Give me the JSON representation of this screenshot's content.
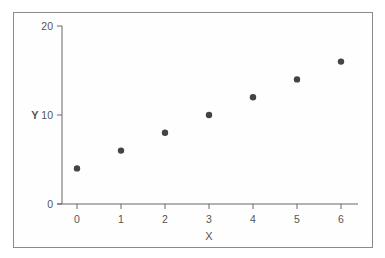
{
  "chart_data": {
    "type": "scatter",
    "title": "",
    "xlabel": "X",
    "ylabel": "Y",
    "x": [
      0,
      1,
      2,
      3,
      4,
      5,
      6
    ],
    "y": [
      4,
      6,
      8,
      10,
      12,
      14,
      16
    ],
    "xticks": [
      "0",
      "1",
      "2",
      "3",
      "4",
      "5",
      "6"
    ],
    "yticks": [
      "0",
      "10",
      "20"
    ],
    "xlim": [
      -0.35,
      6.4
    ],
    "ylim": [
      0,
      20
    ],
    "grid": false,
    "legend": null,
    "marker_color": "#444444"
  }
}
